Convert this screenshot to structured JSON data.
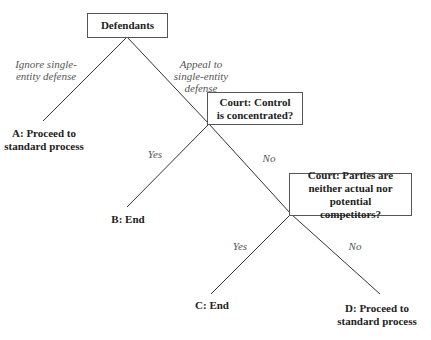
{
  "diagram": {
    "type": "decision-tree",
    "nodes": {
      "root": {
        "label": "Defendants"
      },
      "court1": {
        "label": "Court: Control is concentrated?"
      },
      "court2": {
        "label": "Court: Parties are neither actual nor potential competitors?"
      },
      "leafA": {
        "label": "A: Proceed to standard process"
      },
      "leafB": {
        "label": "B: End"
      },
      "leafC": {
        "label": "C: End"
      },
      "leafD": {
        "label": "D: Proceed to standard process"
      }
    },
    "edges": {
      "root_to_A": {
        "label": "Ignore single-entity defense"
      },
      "root_to_court1": {
        "label": "Appeal to single-entity defense"
      },
      "court1_to_B": {
        "label": "Yes"
      },
      "court1_to_court2": {
        "label": "No"
      },
      "court2_to_C": {
        "label": "Yes"
      },
      "court2_to_D": {
        "label": "No"
      }
    },
    "colors": {
      "line": "#333333",
      "box_border": "#555555",
      "edge_label": "#555555",
      "text": "#222222"
    }
  }
}
